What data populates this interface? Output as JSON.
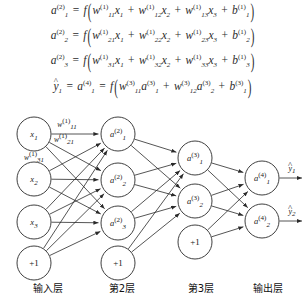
{
  "equations": [
    {
      "id": "eq-a1-layer2",
      "lhs": {
        "base": "a",
        "sub": "1",
        "sup": "(2)"
      },
      "func": "f",
      "terms": [
        {
          "w": {
            "base": "w",
            "sub": "11",
            "sup": "(1)"
          },
          "x": {
            "base": "x",
            "sub": "1"
          }
        },
        {
          "w": {
            "base": "w",
            "sub": "12",
            "sup": "(1)"
          },
          "x": {
            "base": "x",
            "sub": "2"
          }
        },
        {
          "w": {
            "base": "w",
            "sub": "13",
            "sup": "(1)"
          },
          "x": {
            "base": "x",
            "sub": "3"
          }
        }
      ],
      "bias": {
        "base": "b",
        "sub": "1",
        "sup": "(1)"
      }
    },
    {
      "id": "eq-a2-layer2",
      "lhs": {
        "base": "a",
        "sub": "2",
        "sup": "(2)"
      },
      "func": "f",
      "terms": [
        {
          "w": {
            "base": "w",
            "sub": "21",
            "sup": "(1)"
          },
          "x": {
            "base": "x",
            "sub": "1"
          }
        },
        {
          "w": {
            "base": "w",
            "sub": "22",
            "sup": "(1)"
          },
          "x": {
            "base": "x",
            "sub": "2"
          }
        },
        {
          "w": {
            "base": "w",
            "sub": "23",
            "sup": "(1)"
          },
          "x": {
            "base": "x",
            "sub": "3"
          }
        }
      ],
      "bias": {
        "base": "b",
        "sub": "2",
        "sup": "(1)"
      }
    },
    {
      "id": "eq-a3-layer2",
      "lhs": {
        "base": "a",
        "sub": "3",
        "sup": "(2)"
      },
      "func": "f",
      "terms": [
        {
          "w": {
            "base": "w",
            "sub": "31",
            "sup": "(1)"
          },
          "x": {
            "base": "x",
            "sub": "1"
          }
        },
        {
          "w": {
            "base": "w",
            "sub": "32",
            "sup": "(1)"
          },
          "x": {
            "base": "x",
            "sub": "2"
          }
        },
        {
          "w": {
            "base": "w",
            "sub": "33",
            "sup": "(1)"
          },
          "x": {
            "base": "x",
            "sub": "3"
          }
        }
      ],
      "bias": {
        "base": "b",
        "sub": "3",
        "sup": "(1)"
      }
    },
    {
      "id": "eq-yhat1",
      "lhs_hat": {
        "base": "y",
        "sub": "1",
        "hat": "^"
      },
      "lhs": {
        "base": "a",
        "sub": "1",
        "sup": "(4)"
      },
      "func": "f",
      "terms": [
        {
          "w": {
            "base": "w",
            "sub": "11",
            "sup": "(3)"
          },
          "x": {
            "base": "a",
            "sub": "1",
            "sup": "(3)"
          }
        },
        {
          "w": {
            "base": "w",
            "sub": "12",
            "sup": "(3)"
          },
          "x": {
            "base": "a",
            "sub": "2",
            "sup": "(3)"
          }
        }
      ],
      "bias": {
        "base": "b",
        "sub": "1",
        "sup": "(3)"
      }
    }
  ],
  "diagram": {
    "layers": [
      {
        "name": "input-layer",
        "label": "输入层",
        "label_x": 48,
        "label_y": 172,
        "nodes": [
          {
            "id": "x1",
            "base": "x",
            "sub": "1",
            "sup": "",
            "cx": 34,
            "cy": 26,
            "r": 17
          },
          {
            "id": "x2",
            "base": "x",
            "sub": "2",
            "sup": "",
            "cx": 34,
            "cy": 71,
            "r": 17
          },
          {
            "id": "x3",
            "base": "x",
            "sub": "3",
            "sup": "",
            "cx": 34,
            "cy": 114,
            "r": 17
          },
          {
            "id": "bias-input",
            "base": "+1",
            "sub": "",
            "sup": "",
            "cx": 34,
            "cy": 155,
            "r": 17
          }
        ]
      },
      {
        "name": "layer-2",
        "label": "第2层",
        "label_x": 122,
        "label_y": 172,
        "nodes": [
          {
            "id": "a1-2",
            "base": "a",
            "sub": "1",
            "sup": "(2)",
            "cx": 118,
            "cy": 26,
            "r": 17
          },
          {
            "id": "a2-2",
            "base": "a",
            "sub": "2",
            "sup": "(2)",
            "cx": 118,
            "cy": 72,
            "r": 17
          },
          {
            "id": "a3-2",
            "base": "a",
            "sub": "3",
            "sup": "(2)",
            "cx": 118,
            "cy": 115,
            "r": 17
          },
          {
            "id": "bias-layer2",
            "base": "+1",
            "sub": "",
            "sup": "",
            "cx": 118,
            "cy": 155,
            "r": 17
          }
        ]
      },
      {
        "name": "layer-3",
        "label": "第3层",
        "label_x": 201,
        "label_y": 172,
        "nodes": [
          {
            "id": "a1-3",
            "base": "a",
            "sub": "1",
            "sup": "(3)",
            "cx": 195,
            "cy": 50,
            "r": 17
          },
          {
            "id": "a2-3",
            "base": "a",
            "sub": "2",
            "sup": "(3)",
            "cx": 195,
            "cy": 93,
            "r": 17
          },
          {
            "id": "bias-layer3",
            "base": "+1",
            "sub": "",
            "sup": "",
            "cx": 195,
            "cy": 134,
            "r": 17
          }
        ]
      },
      {
        "name": "output-layer",
        "label": "输出层",
        "label_x": 268,
        "label_y": 172,
        "nodes": [
          {
            "id": "a1-4",
            "base": "a",
            "sub": "1",
            "sup": "(4)",
            "cx": 262,
            "cy": 70,
            "r": 17
          },
          {
            "id": "a2-4",
            "base": "a",
            "sub": "2",
            "sup": "(4)",
            "cx": 262,
            "cy": 113,
            "r": 17
          }
        ]
      }
    ],
    "weight_labels": [
      {
        "id": "w11",
        "base": "w",
        "sub": "11",
        "sup": "(1)",
        "x": 67,
        "y": 16
      },
      {
        "id": "w21",
        "base": "w",
        "sub": "21",
        "sup": "(1)",
        "x": 64,
        "y": 31
      },
      {
        "id": "w31",
        "base": "w",
        "sub": "31",
        "sup": "(1)",
        "x": 34,
        "y": 49
      }
    ],
    "outputs": [
      {
        "id": "yhat1",
        "base": "y",
        "sub": "1",
        "hat": "^",
        "x": 292,
        "y": 60
      },
      {
        "id": "yhat2",
        "base": "y",
        "sub": "2",
        "hat": "^",
        "x": 292,
        "y": 103
      }
    ]
  },
  "colors": {
    "stroke": "#2a2a2a",
    "text": "#1a1a1a",
    "background": "#ffffff"
  }
}
